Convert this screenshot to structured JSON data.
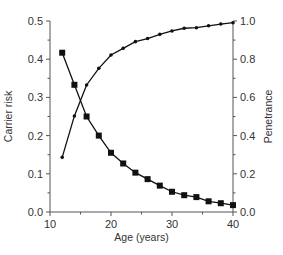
{
  "chart_data": {
    "type": "line",
    "title": "",
    "xlabel": "Age (years)",
    "ylabel": "Carrier risk",
    "y2label": "Penetrance",
    "xlim": [
      10,
      40
    ],
    "ylim": [
      0,
      0.5
    ],
    "y2lim": [
      0,
      1.0
    ],
    "grid": false,
    "legend": "none",
    "x_ticks": [
      "10",
      "20",
      "30",
      "40"
    ],
    "x_minor_ticks": [
      15,
      25,
      35
    ],
    "y_ticks": [
      "0.0",
      "0.1",
      "0.2",
      "0.3",
      "0.4",
      "0.5"
    ],
    "y2_ticks": [
      "0.0",
      "0.2",
      "0.4",
      "0.6",
      "0.8",
      "1.0"
    ],
    "x": [
      12,
      14,
      16,
      18,
      20,
      22,
      24,
      26,
      28,
      30,
      32,
      34,
      36,
      38,
      40
    ],
    "series": [
      {
        "name": "Carrier risk",
        "axis": "left",
        "marker": "square",
        "values": [
          0.417,
          0.333,
          0.25,
          0.2,
          0.155,
          0.127,
          0.103,
          0.086,
          0.069,
          0.053,
          0.044,
          0.039,
          0.028,
          0.023,
          0.018
        ]
      },
      {
        "name": "Penetrance",
        "axis": "right",
        "marker": "dot",
        "values": [
          0.286,
          0.503,
          0.665,
          0.752,
          0.822,
          0.857,
          0.892,
          0.908,
          0.93,
          0.948,
          0.962,
          0.965,
          0.975,
          0.984,
          0.991
        ]
      }
    ]
  }
}
